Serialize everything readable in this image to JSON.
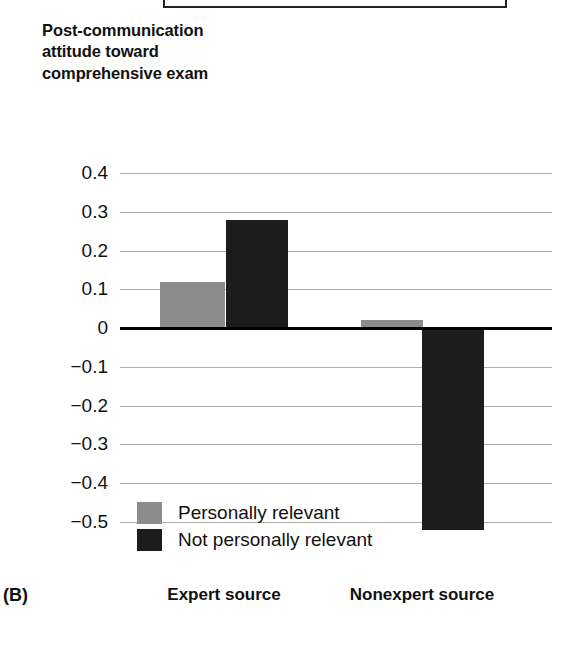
{
  "panel": {
    "letter": "(B)"
  },
  "top_box": {
    "present": true
  },
  "axis_title": "Post-communication attitude toward comprehensive exam",
  "colors": {
    "series_personally_relevant": "#8c8c8c",
    "series_not_personally_relevant": "#1c1c1c",
    "gridline": "#aeaeae",
    "zero_line": "#000000",
    "background": "#ffffff",
    "text": "#111111"
  },
  "chart_data": {
    "type": "bar",
    "title": "",
    "subtitle": "",
    "xlabel": "",
    "ylabel": "Post-communication attitude toward comprehensive exam",
    "categories": [
      "Expert source",
      "Nonexpert source"
    ],
    "series": [
      {
        "name": "Personally relevant",
        "color": "#8c8c8c",
        "values": [
          0.12,
          0.02
        ]
      },
      {
        "name": "Not personally relevant",
        "color": "#1c1c1c",
        "values": [
          0.28,
          -0.52
        ]
      }
    ],
    "ylim": [
      -0.5,
      0.4
    ],
    "ytick_values": [
      0.4,
      0.3,
      0.2,
      0.1,
      0,
      -0.1,
      -0.2,
      -0.3,
      -0.4,
      -0.5
    ],
    "ytick_labels": [
      "0.4",
      "0.3",
      "0.2",
      "0.1",
      "0",
      "−0.1",
      "−0.2",
      "−0.3",
      "−0.4",
      "−0.5"
    ],
    "grid": true,
    "zero_line": true,
    "legend_position": "inside-bottom-left",
    "panel_label": "(B)"
  }
}
